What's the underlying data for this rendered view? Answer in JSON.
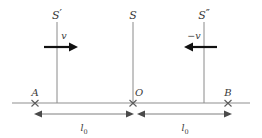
{
  "figure": {
    "background_color": "#ffffff",
    "axis_color": "#8f8f8f",
    "frame_line_color": "#8a8a8a",
    "arrow_color": "#111111",
    "text_color": "#3a3a3a"
  },
  "frames": [
    {
      "id": "frame-left",
      "label": "S",
      "prime": "′",
      "x": 57
    },
    {
      "id": "frame-middle",
      "label": "S",
      "prime": "",
      "x": 133
    },
    {
      "id": "frame-right",
      "label": "S",
      "prime": "″",
      "x": 204
    }
  ],
  "velocities": [
    {
      "id": "velocity-right",
      "label": "v",
      "direction": "right",
      "x": 57
    },
    {
      "id": "velocity-left",
      "label": "−v",
      "direction": "left",
      "x": 204
    }
  ],
  "points": [
    {
      "id": "point-a",
      "label": "A",
      "x": 35
    },
    {
      "id": "point-o",
      "label": "O",
      "x": 133
    },
    {
      "id": "point-b",
      "label": "B",
      "x": 228
    }
  ],
  "dimensions": [
    {
      "id": "dimension-left",
      "symbol": "l",
      "subscript": "0",
      "from": "A",
      "to": "O"
    },
    {
      "id": "dimension-right",
      "symbol": "l",
      "subscript": "0",
      "from": "O",
      "to": "B"
    }
  ]
}
